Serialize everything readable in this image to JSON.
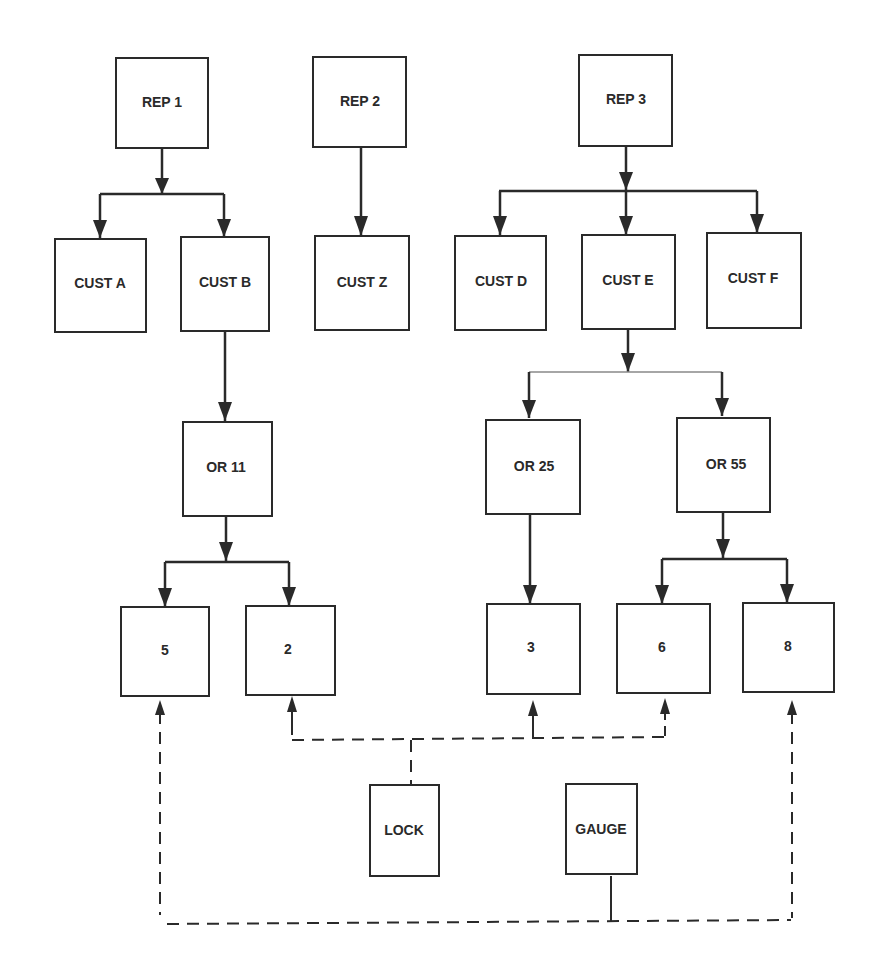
{
  "diagram": {
    "type": "hierarchy",
    "colors": {
      "line": "#2a2a2a",
      "background": "#ffffff"
    },
    "nodes": {
      "rep1": "REP 1",
      "rep2": "REP 2",
      "rep3": "REP 3",
      "custA": "CUST A",
      "custB": "CUST B",
      "custZ": "CUST Z",
      "custD": "CUST D",
      "custE": "CUST E",
      "custF": "CUST F",
      "or11": "OR 11",
      "or25": "OR 25",
      "or55": "OR 55",
      "n5": "5",
      "n2": "2",
      "n3": "3",
      "n6": "6",
      "n8": "8",
      "lock": "LOCK",
      "gauge": "GAUGE"
    },
    "edges_solid": [
      [
        "REP 1",
        "CUST A"
      ],
      [
        "REP 1",
        "CUST B"
      ],
      [
        "REP 2",
        "CUST Z"
      ],
      [
        "REP 3",
        "CUST D"
      ],
      [
        "REP 3",
        "CUST E"
      ],
      [
        "REP 3",
        "CUST F"
      ],
      [
        "CUST B",
        "OR 11"
      ],
      [
        "CUST E",
        "OR 25"
      ],
      [
        "CUST E",
        "OR 55"
      ],
      [
        "OR 11",
        "5"
      ],
      [
        "OR 11",
        "2"
      ],
      [
        "OR 25",
        "3"
      ],
      [
        "OR 55",
        "6"
      ],
      [
        "OR 55",
        "8"
      ]
    ],
    "edges_dashed": [
      [
        "LOCK",
        "2"
      ],
      [
        "LOCK",
        "3"
      ],
      [
        "LOCK",
        "6"
      ],
      [
        "GAUGE",
        "5"
      ],
      [
        "GAUGE",
        "8"
      ]
    ]
  }
}
